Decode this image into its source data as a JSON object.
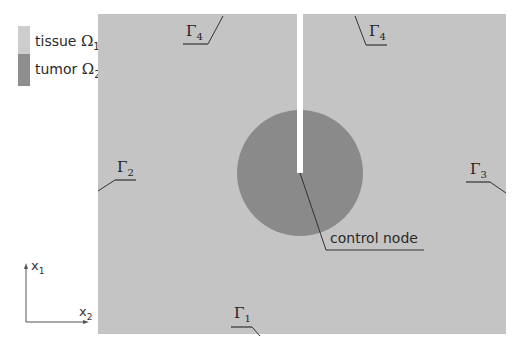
{
  "legend": {
    "items": [
      {
        "label": "tissue",
        "symbol": "Ω",
        "subscript": "1",
        "color": "#cdcdcd"
      },
      {
        "label": "tumor",
        "symbol": "Ω",
        "subscript": "2",
        "color": "#8e8e8e"
      }
    ]
  },
  "domain": {
    "tissue_color": "#c4c4c4",
    "tumor_color": "#8a8a8a",
    "needle_color": "#ffffff"
  },
  "boundaries": [
    {
      "id": "gamma4_left",
      "symbol": "Γ",
      "subscript": "4"
    },
    {
      "id": "gamma4_right",
      "symbol": "Γ",
      "subscript": "4"
    },
    {
      "id": "gamma2",
      "symbol": "Γ",
      "subscript": "2"
    },
    {
      "id": "gamma3",
      "symbol": "Γ",
      "subscript": "3"
    },
    {
      "id": "gamma1",
      "symbol": "Γ",
      "subscript": "1"
    }
  ],
  "annotations": {
    "control_node": "control node"
  },
  "axes": {
    "vertical": {
      "symbol": "x",
      "subscript": "1"
    },
    "horizontal": {
      "symbol": "x",
      "subscript": "2"
    }
  }
}
